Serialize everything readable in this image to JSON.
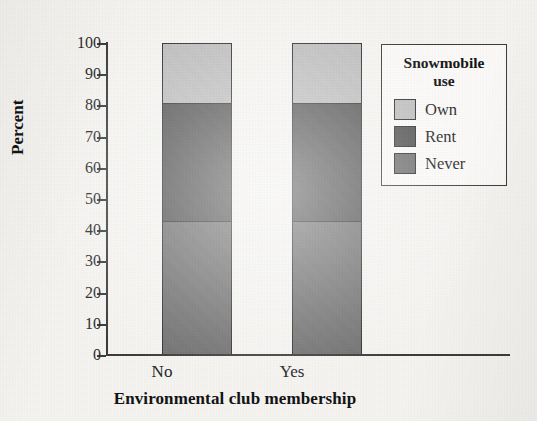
{
  "chart_data": {
    "type": "bar",
    "subtype": "stacked-bar-100-percent",
    "title": "",
    "xlabel": "Environmental club membership",
    "ylabel": "Percent",
    "categories": [
      "No",
      "Yes"
    ],
    "series": [
      {
        "name": "Never",
        "values": [
          43,
          43
        ],
        "color": "#6e6e6e"
      },
      {
        "name": "Rent",
        "values": [
          38,
          38
        ],
        "color": "#4f4f4f"
      },
      {
        "name": "Own",
        "values": [
          19,
          19
        ],
        "color": "#bdbdbd"
      }
    ],
    "stack_order_bottom_to_top": [
      "Never",
      "Rent",
      "Own"
    ],
    "cumulative_boundaries": {
      "No": [
        0,
        43,
        81,
        100
      ],
      "Yes": [
        0,
        43,
        81,
        100
      ]
    },
    "ylim": [
      0,
      100
    ],
    "yticks": [
      0,
      10,
      20,
      30,
      40,
      50,
      60,
      70,
      80,
      90,
      100
    ],
    "ytick_labels": [
      "0",
      "10",
      "20",
      "30",
      "40",
      "50",
      "60",
      "70",
      "80",
      "90",
      "100"
    ],
    "grid": false,
    "legend_position": "right-top"
  },
  "legend": {
    "title_line1": "Snowmobile",
    "title_line2": "use",
    "items": [
      {
        "label": "Own",
        "color": "#bdbdbd"
      },
      {
        "label": "Rent",
        "color": "#4f4f4f"
      },
      {
        "label": "Never",
        "color": "#6e6e6e"
      }
    ]
  },
  "axes": {
    "y_title": "Percent",
    "x_title": "Environmental club membership"
  },
  "bars": [
    {
      "category": "No",
      "segments": [
        {
          "name": "Own",
          "value": 19,
          "color": "#bdbdbd"
        },
        {
          "name": "Rent",
          "value": 38,
          "color": "#4f4f4f"
        },
        {
          "name": "Never",
          "value": 43,
          "color": "#6e6e6e"
        }
      ]
    },
    {
      "category": "Yes",
      "segments": [
        {
          "name": "Own",
          "value": 19,
          "color": "#bdbdbd"
        },
        {
          "name": "Rent",
          "value": 38,
          "color": "#4f4f4f"
        },
        {
          "name": "Never",
          "value": 43,
          "color": "#6e6e6e"
        }
      ]
    }
  ],
  "colors": {
    "own": "#bdbdbd",
    "rent": "#4f4f4f",
    "never": "#6e6e6e",
    "axis": "#3b3b3b",
    "background": "#f5f4f1"
  }
}
